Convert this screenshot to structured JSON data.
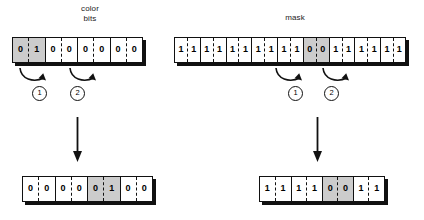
{
  "diagram": {
    "title_left": "color\nbits",
    "title_right": "mask",
    "shift_markers": [
      "1",
      "2"
    ],
    "left_operation": {
      "label": "color bits",
      "source": {
        "bits": [
          "0",
          "1",
          "0",
          "0",
          "0",
          "0",
          "0",
          "0"
        ],
        "bit_count": 8,
        "shaded_bits": [
          0,
          1
        ],
        "shaded_value": "01"
      },
      "result": {
        "bits": [
          "0",
          "0",
          "0",
          "0",
          "0",
          "1",
          "0",
          "0"
        ],
        "bit_count": 8,
        "shaded_bits": [
          4,
          5
        ],
        "shaded_value": "01"
      },
      "shift_arrows": [
        {
          "marker": "1",
          "direction": "right"
        },
        {
          "marker": "2",
          "direction": "right"
        }
      ]
    },
    "right_operation": {
      "label": "mask",
      "source": {
        "bits": [
          "1",
          "1",
          "1",
          "1",
          "1",
          "1",
          "1",
          "1",
          "1",
          "1",
          "0",
          "0",
          "1",
          "1",
          "1",
          "1",
          "1",
          "1"
        ],
        "bit_count": 18,
        "shaded_bits": [
          10,
          11
        ],
        "shaded_value": "00"
      },
      "result": {
        "bits": [
          "1",
          "1",
          "1",
          "1",
          "0",
          "0",
          "1",
          "1"
        ],
        "bit_count": 8,
        "shaded_bits": [
          4,
          5
        ],
        "shaded_value": "00"
      },
      "shift_arrows": [
        {
          "marker": "1",
          "direction": "right"
        },
        {
          "marker": "2",
          "direction": "right"
        }
      ]
    },
    "colors": {
      "shaded_fill": "#cccccc",
      "cell_fill": "#ffffff",
      "stroke": "#111111",
      "background": "#ffffff"
    }
  }
}
